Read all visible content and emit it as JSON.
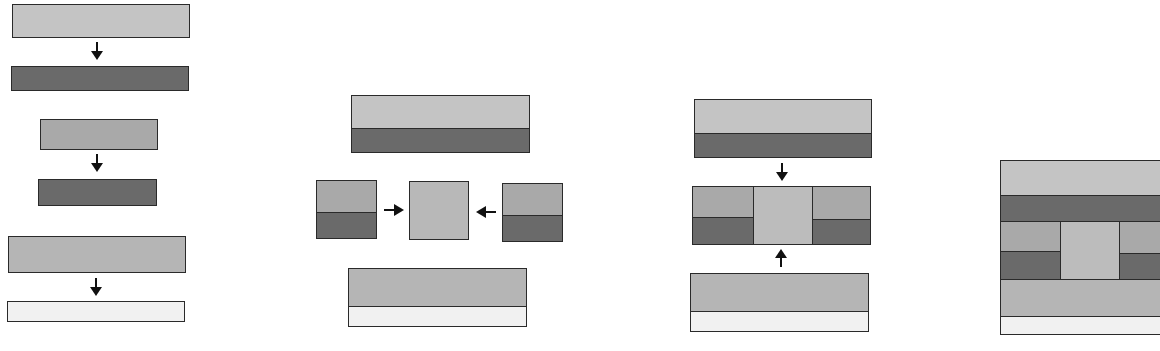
{
  "diagram": {
    "type": "layer-assembly-schematic",
    "colors": {
      "light": "#c4c4c4",
      "medium": "#a9a9a9",
      "dark": "#6a6a6a",
      "very_light": "#f1f1f1",
      "center": "#bcbcbc",
      "outline": "#2a2a2a",
      "arrow": "#111111"
    },
    "panels": [
      {
        "id": "panel-1",
        "description": "Three separate layer pairs, each stacked via downward arrow",
        "steps": [
          {
            "top_layer": "light",
            "bottom_layer": "dark",
            "arrow": "down"
          },
          {
            "top_layer": "medium",
            "bottom_layer": "dark",
            "arrow": "down"
          },
          {
            "top_layer": "light",
            "bottom_layer": "very_light",
            "arrow": "down"
          }
        ]
      },
      {
        "id": "panel-2",
        "description": "Bonded bilayers; side blocks pushed toward center block",
        "elements": [
          {
            "name": "top-bilayer",
            "bands": [
              "light",
              "dark"
            ]
          },
          {
            "name": "left-block",
            "bands": [
              "medium",
              "dark"
            ],
            "arrow": "right"
          },
          {
            "name": "center-block",
            "bands": [
              "medium"
            ]
          },
          {
            "name": "right-block",
            "bands": [
              "medium",
              "dark"
            ],
            "arrow": "left"
          },
          {
            "name": "bottom-bilayer",
            "bands": [
              "medium",
              "very_light"
            ]
          }
        ]
      },
      {
        "id": "panel-3",
        "description": "Top and bottom bilayers converge onto middle composite",
        "elements": [
          {
            "name": "top-bilayer",
            "bands": [
              "light",
              "dark"
            ],
            "arrow": "down"
          },
          {
            "name": "middle-composite",
            "columns": [
              [
                "medium",
                "dark"
              ],
              [
                "center"
              ],
              [
                "medium",
                "dark"
              ]
            ]
          },
          {
            "name": "bottom-bilayer",
            "bands": [
              "medium",
              "very_light"
            ],
            "arrow": "up"
          }
        ]
      },
      {
        "id": "panel-4",
        "description": "Final assembled stack (partially cropped at right edge)",
        "bands": [
          "light",
          "dark",
          "composite-middle",
          "medium",
          "very_light"
        ]
      }
    ]
  }
}
